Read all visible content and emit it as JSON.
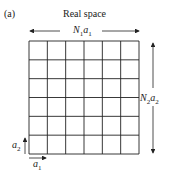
{
  "panel_label": "(a)",
  "title": "Real space",
  "grid": {
    "rows": 6,
    "cols": 6,
    "line_color": "#222222"
  },
  "labels": {
    "width": {
      "main": "N",
      "sub1": "1",
      "var": "a",
      "sub2": "1"
    },
    "height": {
      "main": "N",
      "sub1": "2",
      "var": "a",
      "sub2": "2"
    },
    "a1": {
      "var": "a",
      "sub": "1"
    },
    "a2": {
      "var": "a",
      "sub": "2"
    }
  }
}
